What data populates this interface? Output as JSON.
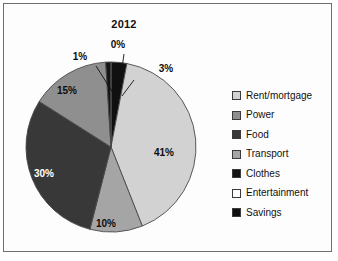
{
  "figure": {
    "title": "2012",
    "frame_color": "#6e6e6e",
    "background": "#ffffff"
  },
  "chart_data": {
    "type": "pie",
    "title": "2012",
    "xlabel": "",
    "ylabel": "",
    "legend_position": "right",
    "grid": false,
    "categories": [
      "Rent/mortgage",
      "Power",
      "Food",
      "Transport",
      "Clothes",
      "Entertainment",
      "Savings"
    ],
    "values": [
      41,
      15,
      30,
      10,
      1,
      0,
      3
    ],
    "labels": [
      "41%",
      "15%",
      "30%",
      "10%",
      "1%",
      "0%",
      "3%"
    ],
    "colors": [
      "#d2d2d2",
      "#8f8f8f",
      "#383838",
      "#a5a5a5",
      "#141414",
      "#ffffff",
      "#101010"
    ],
    "units": "percent"
  },
  "pie": {
    "slices": [
      {
        "name": "savings",
        "label": "3%",
        "value": 3,
        "color": "#101010",
        "label_style": "callout",
        "label_x": 152,
        "label_y": 38,
        "leader": "M 120,46 L 108,62"
      },
      {
        "name": "rent-mortgage",
        "label": "41%",
        "value": 41,
        "color": "#d2d2d2",
        "label_style": "inside-dark",
        "label_x": 150,
        "label_y": 122
      },
      {
        "name": "transport",
        "label": "10%",
        "value": 10,
        "color": "#a5a5a5",
        "label_style": "inside-dark",
        "label_x": 92,
        "label_y": 193
      },
      {
        "name": "food",
        "label": "30%",
        "value": 30,
        "color": "#383838",
        "label_style": "inside-light",
        "label_x": 30,
        "label_y": 143
      },
      {
        "name": "power",
        "label": "15%",
        "value": 15,
        "color": "#8f8f8f",
        "label_style": "inside-dark",
        "label_x": 53,
        "label_y": 60
      },
      {
        "name": "clothes",
        "label": "1%",
        "value": 1,
        "color": "#141414",
        "label_style": "callout",
        "label_x": 66,
        "label_y": 26,
        "leader": "M 82,32 L 101,62"
      },
      {
        "name": "entertainment",
        "label": "0%",
        "value": 0,
        "color": "#ffffff",
        "label_style": "callout",
        "label_x": 104,
        "label_y": 14,
        "leader": "M 110,20 L 104,62"
      }
    ],
    "center_x": 97,
    "center_y": 113,
    "radius": 85,
    "outline_color": "#4a4a4a"
  },
  "legend": {
    "items": [
      {
        "label": "Rent/mortgage",
        "color": "#d2d2d2"
      },
      {
        "label": "Power",
        "color": "#8f8f8f"
      },
      {
        "label": "Food",
        "color": "#383838"
      },
      {
        "label": "Transport",
        "color": "#a5a5a5"
      },
      {
        "label": "Clothes",
        "color": "#141414"
      },
      {
        "label": "Entertainment",
        "color": "#ffffff"
      },
      {
        "label": "Savings",
        "color": "#101010"
      }
    ]
  }
}
